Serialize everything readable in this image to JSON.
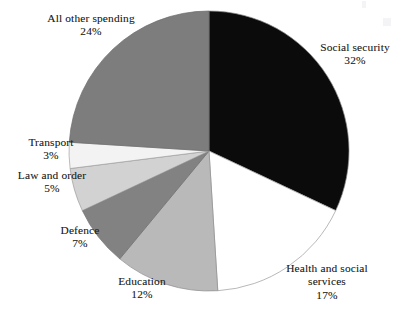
{
  "figure": {
    "name": "government-spending-pie-chart",
    "background_color": "#ffffff"
  },
  "chart_data": {
    "type": "pie",
    "title": "",
    "subtitle": "",
    "xlabel": "",
    "ylabel": "",
    "legend_position": "none",
    "labels_position": "outside-callout",
    "grid": false,
    "start_angle_deg": 0,
    "direction": "clockwise",
    "units": "percent",
    "total": 100,
    "categories": [
      "Social security",
      "Health and social services",
      "Education",
      "Defence",
      "Law and order",
      "Transport",
      "All other spending"
    ],
    "values": [
      32,
      17,
      12,
      7,
      5,
      3,
      24
    ],
    "value_suffix": "%",
    "slices": [
      {
        "label": "Social security",
        "label_lines": [
          "Social security"
        ],
        "value": 32,
        "value_text": "32%",
        "color": "#0b0b0b",
        "stroke": "#8c8c8c",
        "start_deg": 0,
        "end_deg": 115.2
      },
      {
        "label": "Health and social services",
        "label_lines": [
          "Health and social",
          "services"
        ],
        "value": 17,
        "value_text": "17%",
        "color": "#ffffff",
        "stroke": "#9a9a9a",
        "start_deg": 115.2,
        "end_deg": 176.4
      },
      {
        "label": "Education",
        "label_lines": [
          "Education"
        ],
        "value": 12,
        "value_text": "12%",
        "color": "#b9b9b9",
        "stroke": "#8f8f8f",
        "start_deg": 176.4,
        "end_deg": 219.6
      },
      {
        "label": "Defence",
        "label_lines": [
          "Defence"
        ],
        "value": 7,
        "value_text": "7%",
        "color": "#828282",
        "stroke": "#6d6d6d",
        "start_deg": 219.6,
        "end_deg": 244.8
      },
      {
        "label": "Law and order",
        "label_lines": [
          "Law and order"
        ],
        "value": 5,
        "value_text": "5%",
        "color": "#d2d2d2",
        "stroke": "#9a9a9a",
        "start_deg": 244.8,
        "end_deg": 262.8
      },
      {
        "label": "Transport",
        "label_lines": [
          "Transport"
        ],
        "value": 3,
        "value_text": "3%",
        "color": "#f3f3f3",
        "stroke": "#a0a0a0",
        "start_deg": 262.8,
        "end_deg": 273.6
      },
      {
        "label": "All other spending",
        "label_lines": [
          "All other spending"
        ],
        "value": 24,
        "value_text": "24%",
        "color": "#7d7d7d",
        "stroke": "#6b6b6b",
        "start_deg": 273.6,
        "end_deg": 360
      }
    ]
  },
  "labels": {
    "all_other_spending": {
      "line1": "All other spending",
      "percent": "24%"
    },
    "social_security": {
      "line1": "Social security",
      "percent": "32%"
    },
    "transport": {
      "line1": "Transport",
      "percent": "3%"
    },
    "law_and_order": {
      "line1": "Law and order",
      "percent": "5%"
    },
    "defence": {
      "line1": "Defence",
      "percent": "7%"
    },
    "education": {
      "line1": "Education",
      "percent": "12%"
    },
    "health_and_social_services": {
      "line1": "Health and social",
      "line2": "services",
      "percent": "17%"
    }
  }
}
